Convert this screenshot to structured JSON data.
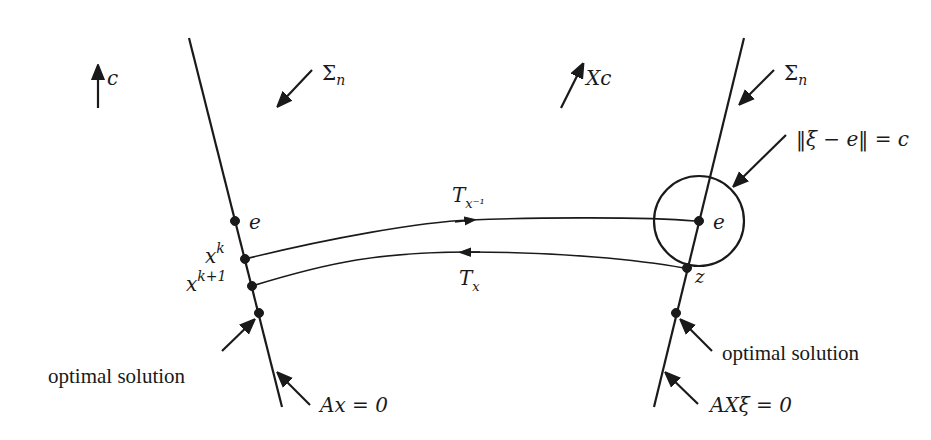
{
  "left_panel": {
    "direction_label": "c",
    "cone_label": "Σ",
    "cone_sub": "n",
    "point_e": "e",
    "point_xk": "x",
    "point_xk_sup": "k",
    "point_xk1": "x",
    "point_xk1_sup": "k+1",
    "optimal_label": "optimal solution",
    "line_label": "Ax = 0"
  },
  "right_panel": {
    "direction_label": "Xc",
    "cone_label": "Σ",
    "cone_sub": "n",
    "ball_label": "‖ξ − e‖ = c",
    "point_e": "e",
    "point_z": "z",
    "optimal_label": "optimal solution",
    "line_label": "AXξ = 0"
  },
  "maps": {
    "forward": "T",
    "forward_sub": "x⁻¹",
    "backward": "T",
    "backward_sub": "x"
  },
  "colors": {
    "ink": "#1a1a1a",
    "background": "#ffffff"
  }
}
